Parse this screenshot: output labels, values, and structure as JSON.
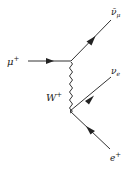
{
  "diagram": {
    "type": "feynman",
    "colors": {
      "line": "#333333",
      "text": "#222222",
      "background": "#ffffff"
    },
    "particles": {
      "incoming_muon": {
        "symbol": "μ",
        "charge": "+"
      },
      "outgoing_antineutrino_muon": {
        "symbol": "ν̄",
        "subscript": "μ"
      },
      "boson": {
        "symbol": "W",
        "charge": "+"
      },
      "neutrino_electron": {
        "symbol": "ν",
        "subscript": "e"
      },
      "positron": {
        "symbol": "e",
        "charge": "+"
      }
    }
  }
}
